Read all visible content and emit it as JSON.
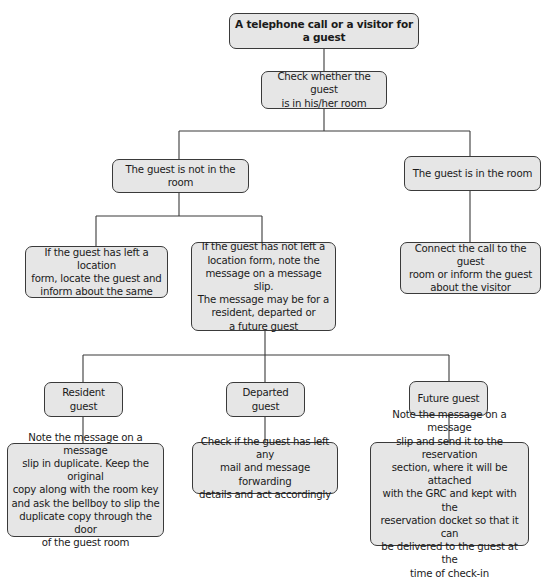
{
  "diagram": {
    "type": "flowchart",
    "nodes": {
      "root": "A telephone call or a visitor for a guest",
      "check": "Check whether the guest\nis in his/her room",
      "not_in_room": "The guest is not in the room",
      "in_room": "The guest is in the room",
      "left_location_form": "If the guest has left a location\nform, locate the guest and\ninform about the same",
      "not_left_location_form": "If the guest has not left a\nlocation form, note the\nmessage on a message slip.\nThe message may be for a\nresident, departed or\na future guest",
      "connect_call": "Connect the call to the guest\nroom or inform the guest\nabout the visitor",
      "resident_guest": "Resident guest",
      "departed_guest": "Departed guest",
      "future_guest": "Future guest",
      "resident_action": "Note the message on a message\nslip in duplicate. Keep the original\ncopy along with the room key\nand ask the bellboy to slip the\nduplicate copy through the door\nof the guest room",
      "departed_action": "Check if the guest has left any\nmail and message forwarding\ndetails and act accordingly",
      "future_action": "Note the message on a message\nslip and send it to the reservation\nsection, where it will be attached\nwith the GRC and kept with the\nreservation docket so that it can\nbe delivered to the guest at the\ntime of check-in"
    },
    "edges": [
      [
        "root",
        "check"
      ],
      [
        "check",
        "not_in_room"
      ],
      [
        "check",
        "in_room"
      ],
      [
        "not_in_room",
        "left_location_form"
      ],
      [
        "not_in_room",
        "not_left_location_form"
      ],
      [
        "in_room",
        "connect_call"
      ],
      [
        "not_left_location_form",
        "resident_guest"
      ],
      [
        "not_left_location_form",
        "departed_guest"
      ],
      [
        "not_left_location_form",
        "future_guest"
      ],
      [
        "resident_guest",
        "resident_action"
      ],
      [
        "departed_guest",
        "departed_action"
      ],
      [
        "future_guest",
        "future_action"
      ]
    ],
    "colors": {
      "box_fill": "#e6e6e6",
      "box_border": "#3a3a3a",
      "connector": "#3a3a3a",
      "background": "#ffffff"
    }
  }
}
